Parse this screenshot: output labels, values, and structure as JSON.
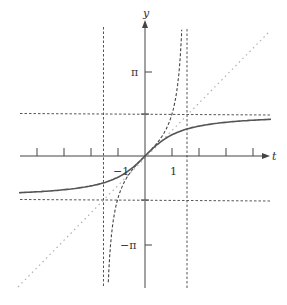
{
  "figure": {
    "axes": {
      "x_label": "t",
      "y_label": "y",
      "x_tick_labels": [
        {
          "value": -1,
          "label": "−1"
        },
        {
          "value": 1,
          "label": "1"
        }
      ],
      "x_ticks": [
        -4,
        -3,
        -2,
        -1,
        1,
        2,
        3,
        4
      ],
      "y_tick_labels": [
        {
          "value": 3.14159,
          "label": "π"
        },
        {
          "value": -3.14159,
          "label": "−π"
        }
      ],
      "y_ticks": [
        3.14159,
        1.5708,
        -1.5708,
        -3.14159
      ]
    },
    "curves": [
      {
        "name": "arctan",
        "expression": "y = arctan t",
        "style": "solid"
      },
      {
        "name": "tan",
        "expression": "y = tan t",
        "style": "dashed"
      },
      {
        "name": "identity",
        "expression": "y = t",
        "style": "dotted"
      }
    ],
    "asymptotes": [
      {
        "type": "vertical",
        "value": "t = -π/2"
      },
      {
        "type": "vertical",
        "value": "t = π/2"
      },
      {
        "type": "horizontal",
        "value": "y = π/2"
      },
      {
        "type": "horizontal",
        "value": "y = -π/2"
      }
    ],
    "colors": {
      "axis": "#444444",
      "solid_curve": "#555555",
      "dashed": "#444444",
      "dotted": "#aaaaaa"
    }
  },
  "labels": {
    "x_axis": "t",
    "y_axis": "y",
    "tick_neg1": "−1",
    "tick_pos1": "1",
    "tick_pi": "π",
    "tick_neg_pi": "−π"
  }
}
